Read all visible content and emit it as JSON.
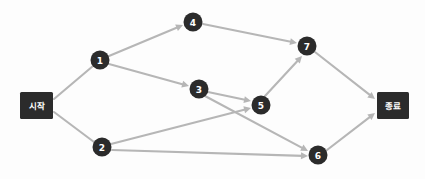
{
  "diagram": {
    "background_color": "#fdfdfd",
    "node_color": "#2b2b2b",
    "node_text_color": "#ffffff",
    "edge_color": "#b6b6b6",
    "width": 425,
    "height": 179
  },
  "terminals": {
    "start": {
      "label": "시작",
      "x": 20,
      "y": 92,
      "w": 33,
      "h": 27
    },
    "end": {
      "label": "종료",
      "x": 377,
      "y": 92,
      "w": 32,
      "h": 27
    }
  },
  "nodes": [
    {
      "id": "1",
      "label": "1",
      "cx": 100,
      "cy": 60,
      "r": 9.5
    },
    {
      "id": "2",
      "label": "2",
      "cx": 102,
      "cy": 147,
      "r": 9.5
    },
    {
      "id": "3",
      "label": "3",
      "cx": 199,
      "cy": 89,
      "r": 9.5
    },
    {
      "id": "4",
      "label": "4",
      "cx": 193,
      "cy": 22,
      "r": 9.5
    },
    {
      "id": "5",
      "label": "5",
      "cx": 261,
      "cy": 105,
      "r": 9.5
    },
    {
      "id": "6",
      "label": "6",
      "cx": 318,
      "cy": 155,
      "r": 9.5
    },
    {
      "id": "7",
      "label": "7",
      "cx": 307,
      "cy": 46,
      "r": 9.5
    }
  ],
  "edges": [
    {
      "id": "start-1",
      "from": "시작",
      "to": "1",
      "x1": 54,
      "y1": 99,
      "x2": 93,
      "y2": 66,
      "arrow": false
    },
    {
      "id": "start-2",
      "from": "시작",
      "to": "2",
      "x1": 54,
      "y1": 112,
      "x2": 94,
      "y2": 142,
      "arrow": false
    },
    {
      "id": "1-4",
      "from": "1",
      "to": "4",
      "x1": 109,
      "y1": 56,
      "x2": 183,
      "y2": 25,
      "arrow": true
    },
    {
      "id": "1-3",
      "from": "1",
      "to": "3",
      "x1": 109,
      "y1": 64,
      "x2": 189,
      "y2": 86,
      "arrow": true
    },
    {
      "id": "4-7",
      "from": "4",
      "to": "7",
      "x1": 203,
      "y1": 24,
      "x2": 297,
      "y2": 43,
      "arrow": true
    },
    {
      "id": "3-5",
      "from": "3",
      "to": "5",
      "x1": 208,
      "y1": 92,
      "x2": 251,
      "y2": 101,
      "arrow": true
    },
    {
      "id": "3-6",
      "from": "3",
      "to": "6",
      "x1": 205,
      "y1": 96,
      "x2": 308,
      "y2": 151,
      "arrow": true
    },
    {
      "id": "2-5",
      "from": "2",
      "to": "5",
      "x1": 111,
      "y1": 144,
      "x2": 251,
      "y2": 108,
      "arrow": true
    },
    {
      "id": "2-6",
      "from": "2",
      "to": "6",
      "x1": 112,
      "y1": 150,
      "x2": 308,
      "y2": 156,
      "arrow": true
    },
    {
      "id": "5-7",
      "from": "5",
      "to": "7",
      "x1": 265,
      "y1": 96,
      "x2": 302,
      "y2": 56,
      "arrow": true
    },
    {
      "id": "7-end",
      "from": "7",
      "to": "종료",
      "x1": 315,
      "y1": 52,
      "x2": 375,
      "y2": 99,
      "arrow": true
    },
    {
      "id": "6-end",
      "from": "6",
      "to": "종료",
      "x1": 327,
      "y1": 150,
      "x2": 375,
      "y2": 113,
      "arrow": true
    }
  ]
}
